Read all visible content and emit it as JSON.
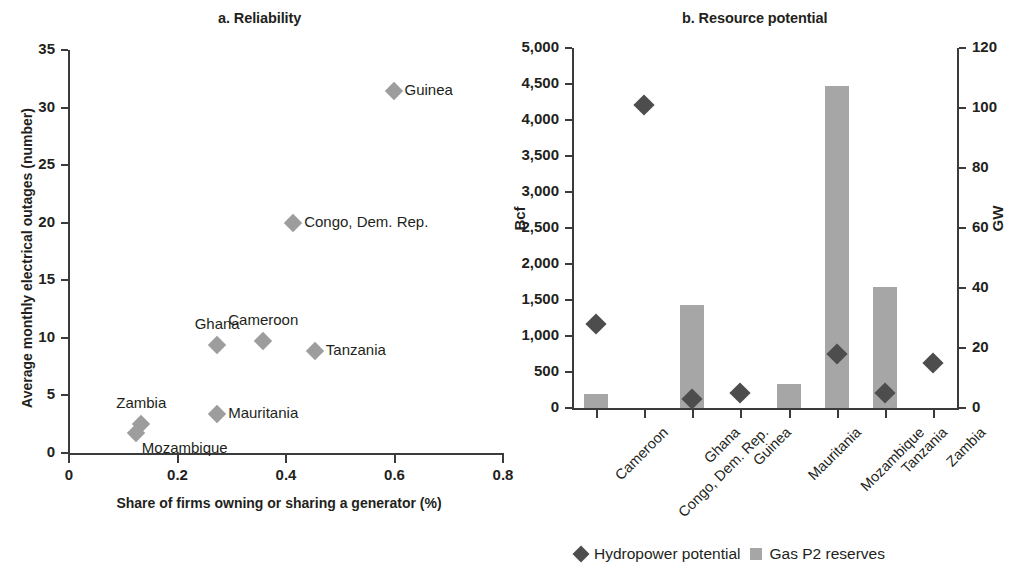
{
  "panel_a": {
    "title": "a. Reliability",
    "ylabel": "Average monthly electrical outages (number)",
    "xlabel": "Share of firms owning or sharing a generator (%)"
  },
  "panel_b": {
    "title": "b. Resource potential",
    "ylabel_left": "Bcf",
    "ylabel_right": "GW"
  },
  "legend": {
    "hydro_label": "Hydropower potential",
    "gas_label": "Gas P2 reserves",
    "hydro_color": "#4d4d4d",
    "gas_color": "#a6a6a6"
  },
  "chart_data": [
    {
      "type": "scatter",
      "title": "a. Reliability",
      "xlabel": "Share of firms owning or sharing a generator (%)",
      "ylabel": "Average monthly electrical outages (number)",
      "xlim": [
        0,
        0.8
      ],
      "ylim": [
        0,
        35
      ],
      "xticks": [
        "0",
        "0.2",
        "0.4",
        "0.6",
        "0.8"
      ],
      "xtick_values": [
        0,
        0.2,
        0.4,
        0.6,
        0.8
      ],
      "yticks": [
        "0",
        "5",
        "10",
        "15",
        "20",
        "25",
        "30",
        "35"
      ],
      "ytick_values": [
        0,
        5,
        10,
        15,
        20,
        25,
        30,
        35
      ],
      "grid": false,
      "legend": "none",
      "marker_color": "#9d9d9d",
      "points": [
        {
          "label": "Guinea",
          "x": 0.6,
          "y": 31.4,
          "label_pos": "right"
        },
        {
          "label": "Congo, Dem. Rep.",
          "x": 0.415,
          "y": 20.0,
          "label_pos": "right"
        },
        {
          "label": "Cameroon",
          "x": 0.36,
          "y": 9.7,
          "label_pos": "above"
        },
        {
          "label": "Ghana",
          "x": 0.275,
          "y": 9.4,
          "label_pos": "above"
        },
        {
          "label": "Tanzania",
          "x": 0.455,
          "y": 8.9,
          "label_pos": "right"
        },
        {
          "label": "Mauritania",
          "x": 0.275,
          "y": 3.4,
          "label_pos": "right"
        },
        {
          "label": "Zambia",
          "x": 0.135,
          "y": 2.5,
          "label_pos": "above"
        },
        {
          "label": "Mozambique",
          "x": 0.125,
          "y": 1.7,
          "label_pos": "below-right"
        }
      ]
    },
    {
      "type": "bar",
      "title": "b. Resource potential",
      "categories": [
        "Cameroon",
        "Congo, Dem. Rep.",
        "Ghana",
        "Guinea",
        "Mauritania",
        "Mozambique",
        "Tanzania",
        "Zambia"
      ],
      "xlabel": "",
      "ylabel": "Bcf",
      "ylabel_right": "GW",
      "ylim": [
        0,
        5000
      ],
      "ylim_right": [
        0,
        120
      ],
      "yticks": [
        "0",
        "500",
        "1,000",
        "1,500",
        "2,000",
        "2,500",
        "3,000",
        "3,500",
        "4,000",
        "4,500",
        "5,000"
      ],
      "ytick_values": [
        0,
        500,
        1000,
        1500,
        2000,
        2500,
        3000,
        3500,
        4000,
        4500,
        5000
      ],
      "yticks_right": [
        "0",
        "20",
        "40",
        "60",
        "80",
        "100",
        "120"
      ],
      "ytick_values_right": [
        0,
        20,
        40,
        60,
        80,
        100,
        120
      ],
      "grid": false,
      "legend": "bottom",
      "series": [
        {
          "name": "Gas P2 reserves",
          "type": "bar",
          "axis": "left",
          "unit": "Bcf",
          "color": "#a6a6a6",
          "values": [
            195,
            0,
            1435,
            0,
            335,
            4470,
            1680,
            0
          ]
        },
        {
          "name": "Hydropower potential",
          "type": "scatter",
          "axis": "right",
          "unit": "GW",
          "color": "#4d4d4d",
          "values": [
            28,
            101,
            3,
            5,
            null,
            18,
            5,
            15
          ],
          "values_in_bcf_scale": [
            1165,
            4220,
            125,
            205,
            null,
            740,
            205,
            635
          ]
        }
      ]
    }
  ]
}
